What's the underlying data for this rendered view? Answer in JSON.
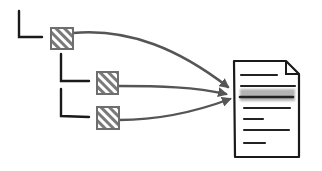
{
  "diagram": {
    "colors": {
      "background": "#ffffff",
      "tree_lines": "#1a1a1a",
      "node_border": "#6e6e6e",
      "node_hatch": "#7a7a7a",
      "arrow": "#555555",
      "document_outline": "#1a1a1a",
      "document_lines": "#222222",
      "highlight": "#a8a8a8"
    },
    "nodes": [
      {
        "id": "root",
        "level": 0,
        "x": 51,
        "y": 28,
        "size": 22
      },
      {
        "id": "child-1",
        "level": 1,
        "x": 97,
        "y": 72,
        "size": 21
      },
      {
        "id": "child-2",
        "level": 1,
        "x": 97,
        "y": 107,
        "size": 22
      }
    ],
    "edges": [
      {
        "from": "root",
        "to": "document"
      },
      {
        "from": "child-1",
        "to": "document"
      },
      {
        "from": "child-2",
        "to": "document"
      }
    ],
    "document": {
      "x": 233,
      "y": 60,
      "width": 65,
      "height": 98,
      "text_lines": 7,
      "highlighted_line_index": 2
    }
  }
}
